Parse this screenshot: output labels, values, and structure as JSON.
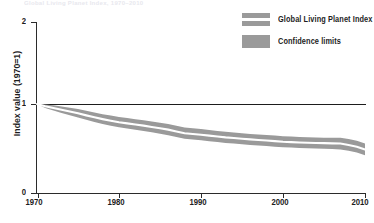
{
  "header": {
    "clipped_caption": "Global Living Planet Index, 1970–2010"
  },
  "legend": {
    "position": "top-right",
    "items": [
      {
        "label": "Global Living Planet Index",
        "swatch": "striped-band-swatch",
        "color": "#9a9a9a"
      },
      {
        "label": "Confidence limits",
        "swatch": "solid-band-swatch",
        "color": "#9a9a9a"
      }
    ]
  },
  "axes": {
    "y_title": "Index value (1970=1)",
    "y_ticks": [
      "0",
      "1",
      "2"
    ],
    "x_ticks": [
      "1970",
      "1980",
      "1990",
      "2000",
      "2010"
    ]
  },
  "colors": {
    "band": "#9a9a9a",
    "line": "#ffffff",
    "axis": "#2b2b2b",
    "text": "#1d1d1d",
    "background": "#ffffff"
  },
  "chart_data": {
    "type": "line",
    "title": "Global Living Planet Index, 1970–2010",
    "xlabel": "",
    "ylabel": "Index value (1970=1)",
    "xlim": [
      1970,
      2010
    ],
    "ylim": [
      0,
      2
    ],
    "grid": false,
    "legend_position": "top-right",
    "reference_line": {
      "y": 1,
      "label": "1970 baseline"
    },
    "x": [
      1970,
      1971,
      1972,
      1973,
      1974,
      1975,
      1976,
      1977,
      1978,
      1979,
      1980,
      1981,
      1982,
      1983,
      1984,
      1985,
      1986,
      1987,
      1988,
      1989,
      1990,
      1991,
      1992,
      1993,
      1994,
      1995,
      1996,
      1997,
      1998,
      1999,
      2000,
      2001,
      2002,
      2003,
      2004,
      2005,
      2006,
      2007,
      2008,
      2009,
      2010
    ],
    "series": [
      {
        "name": "Global Living Planet Index",
        "values": [
          1.0,
          0.975,
          0.955,
          0.935,
          0.915,
          0.895,
          0.872,
          0.85,
          0.83,
          0.812,
          0.795,
          0.782,
          0.77,
          0.757,
          0.742,
          0.728,
          0.712,
          0.692,
          0.672,
          0.663,
          0.655,
          0.645,
          0.635,
          0.625,
          0.618,
          0.61,
          0.602,
          0.596,
          0.59,
          0.583,
          0.576,
          0.572,
          0.568,
          0.565,
          0.562,
          0.56,
          0.558,
          0.556,
          0.54,
          0.52,
          0.49
        ]
      },
      {
        "name": "Confidence limits upper",
        "values": [
          1.0,
          0.995,
          0.985,
          0.972,
          0.958,
          0.944,
          0.925,
          0.905,
          0.886,
          0.87,
          0.855,
          0.842,
          0.83,
          0.818,
          0.804,
          0.79,
          0.775,
          0.756,
          0.736,
          0.727,
          0.718,
          0.708,
          0.698,
          0.688,
          0.68,
          0.672,
          0.664,
          0.658,
          0.652,
          0.645,
          0.638,
          0.634,
          0.63,
          0.627,
          0.624,
          0.622,
          0.622,
          0.622,
          0.606,
          0.586,
          0.556
        ]
      },
      {
        "name": "Confidence limits lower",
        "values": [
          1.0,
          0.955,
          0.928,
          0.9,
          0.874,
          0.848,
          0.822,
          0.798,
          0.776,
          0.756,
          0.738,
          0.724,
          0.712,
          0.698,
          0.682,
          0.667,
          0.65,
          0.63,
          0.61,
          0.6,
          0.592,
          0.582,
          0.572,
          0.562,
          0.556,
          0.548,
          0.54,
          0.534,
          0.528,
          0.521,
          0.514,
          0.51,
          0.506,
          0.503,
          0.5,
          0.498,
          0.494,
          0.49,
          0.474,
          0.454,
          0.424
        ]
      }
    ]
  }
}
